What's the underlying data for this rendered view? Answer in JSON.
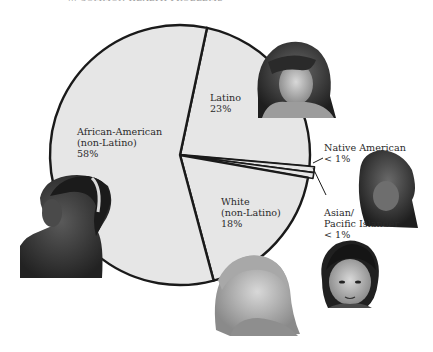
{
  "header": {
    "title_fragment": "... COMMON HEALTH PROBLEMS"
  },
  "chart_data": {
    "type": "pie",
    "title": "",
    "slices": [
      {
        "label": "Latino",
        "value": 23,
        "display": "23%",
        "start_deg": 12,
        "end_deg": 95
      },
      {
        "label": "Native American",
        "value": 0.5,
        "display": "<1%",
        "start_deg": 95,
        "end_deg": 97.5
      },
      {
        "label": "Asian/Pacific Islander",
        "value": 0.5,
        "display": "<1%",
        "start_deg": 97.5,
        "end_deg": 100
      },
      {
        "label": "White (non-Latino)",
        "value": 18,
        "display": "18%",
        "start_deg": 100,
        "end_deg": 165
      },
      {
        "label": "African-American (non-Latino)",
        "value": 58,
        "display": "58%",
        "start_deg": 165,
        "end_deg": 372
      }
    ],
    "colors": {
      "fill": "#e6e6e6",
      "stroke": "#1a1a1a"
    },
    "legend": "none (inline labels)"
  },
  "labels": {
    "african_american": {
      "line1": "African-American",
      "line2": "(non-Latino)",
      "line3": "58%"
    },
    "latino": {
      "line1": "Latino",
      "line2": "23%"
    },
    "white": {
      "line1": "White",
      "line2": "(non-Latino)",
      "line3": "18%"
    },
    "native_american": {
      "line1": "Native American",
      "line2": "< 1%"
    },
    "asian": {
      "line1": "Asian/",
      "line2": "Pacific Islander",
      "line3": "< 1%"
    }
  },
  "photos": [
    {
      "name": "latino-child-photo"
    },
    {
      "name": "native-american-child-photo"
    },
    {
      "name": "african-american-child-photo"
    },
    {
      "name": "white-child-photo"
    },
    {
      "name": "asian-child-photo"
    }
  ]
}
